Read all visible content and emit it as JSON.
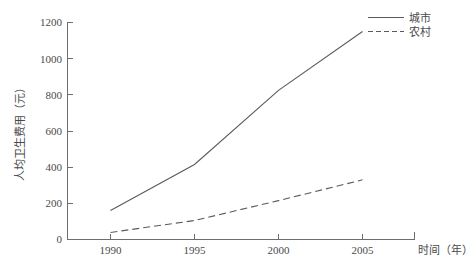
{
  "chart_data": {
    "type": "line",
    "title": "",
    "subtitle": "",
    "xlabel": "时间（年）",
    "ylabel": "人均卫生费用（元）",
    "x": [
      1990,
      1995,
      2000,
      2005
    ],
    "categories": [
      "1990",
      "1995",
      "2000",
      "2005"
    ],
    "xtick_labels": [
      "1990",
      "1995",
      "2000",
      "2005"
    ],
    "ytick_labels": [
      "0",
      "200",
      "400",
      "600",
      "800",
      "1000",
      "1200"
    ],
    "ytick_values": [
      0,
      200,
      400,
      600,
      800,
      1000,
      1200
    ],
    "ylim": [
      0,
      1200
    ],
    "xlim": [
      1988.2,
      2007.5
    ],
    "grid": false,
    "legend_position": "top-right",
    "series": [
      {
        "name": "城市",
        "style": "solid",
        "color": "#5a5a5a",
        "values": [
          160,
          415,
          825,
          1150
        ]
      },
      {
        "name": "农村",
        "style": "dashed",
        "color": "#5a5a5a",
        "values": [
          39,
          105,
          215,
          330
        ]
      }
    ]
  },
  "legend": {
    "items": [
      {
        "label": "城市",
        "style": "solid"
      },
      {
        "label": "农村",
        "style": "dashed"
      }
    ]
  },
  "axes": {
    "x_title": "时间（年）",
    "y_title": "人均卫生费用（元）"
  }
}
